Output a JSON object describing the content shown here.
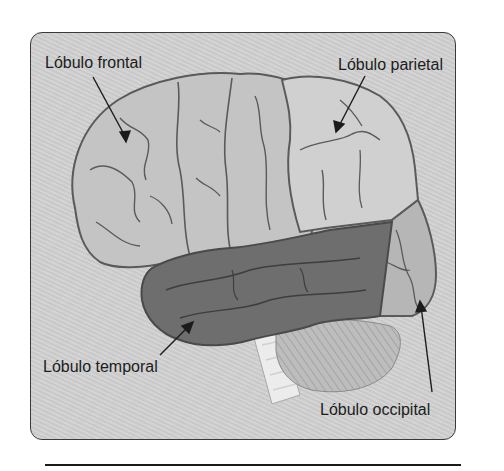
{
  "diagram": {
    "type": "anatomical-illustration",
    "labels": {
      "frontal": "Lóbulo frontal",
      "parietal": "Lóbulo parietal",
      "temporal": "Lóbulo temporal",
      "occipital": "Lóbulo occipital"
    },
    "colors": {
      "frame_background": "#cfcfcf",
      "frame_border": "#3a3a3a",
      "frontal_fill": "#c4c4c4",
      "parietal_fill": "#d0d0d0",
      "temporal_fill": "#6e6e6e",
      "occipital_fill": "#b6b6b6",
      "cerebellum_fill": "#bdbdbd",
      "brainstem_fill": "#ececec",
      "sulci_stroke": "#5a5a5a",
      "label_text": "#1c1c1c"
    }
  }
}
